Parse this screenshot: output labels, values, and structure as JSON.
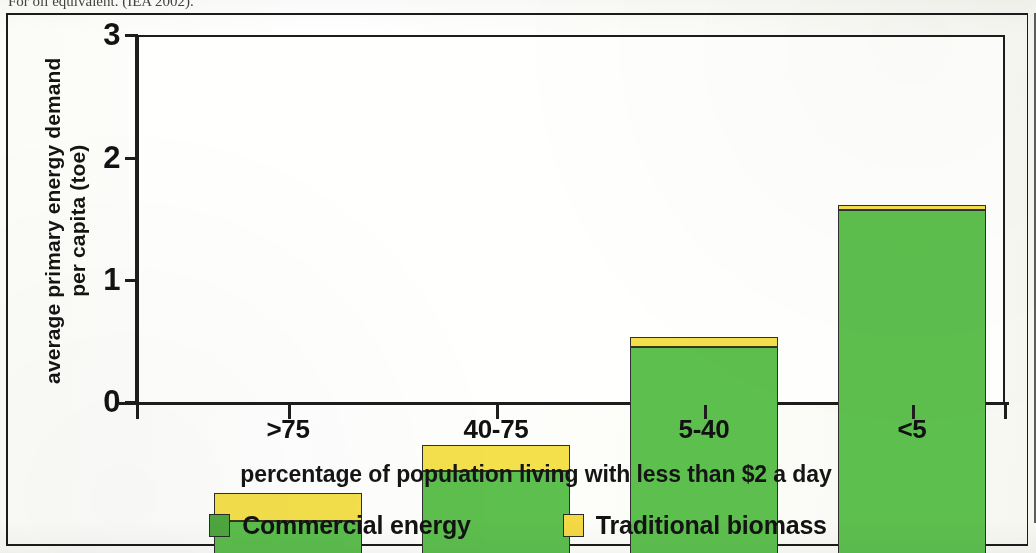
{
  "caption_clipped": "For oil equivalent. (IEA 2002).",
  "chart_data": {
    "type": "bar",
    "stacked": true,
    "title": "",
    "xlabel": "percentage of population living with less than $2 a day",
    "ylabel": "average primary energy demand per capita (toe)",
    "ylabel_line1": "average primary energy demand",
    "ylabel_line2": "per capita (toe)",
    "categories": [
      ">75",
      "40-75",
      "5-40",
      "<5"
    ],
    "ylim": [
      0,
      3
    ],
    "yticks": [
      "0",
      "1",
      "2",
      "3"
    ],
    "ytick_values": [
      0,
      1,
      2,
      3
    ],
    "grid": false,
    "legend_position": "bottom",
    "series": [
      {
        "name": "Commercial energy",
        "color": "#5dbf4e",
        "values": [
          0.26,
          0.67,
          1.68,
          2.8
        ]
      },
      {
        "name": "Traditional biomass",
        "color": "#f4e04b",
        "values": [
          0.23,
          0.21,
          0.08,
          0.04
        ]
      }
    ],
    "totals": [
      0.49,
      0.88,
      1.76,
      2.84
    ]
  },
  "axes": {
    "y_title_line1": "average primary energy demand",
    "y_title_line2": "per capita (toe)",
    "y_ticks": [
      "3",
      "2",
      "1",
      "0"
    ],
    "x_categories": [
      ">75",
      "40-75",
      "5-40",
      "<5"
    ],
    "x_title": "percentage of population living with less than $2 a day"
  },
  "legend": {
    "items": [
      {
        "label": "Commercial energy",
        "color": "#5dbf4e"
      },
      {
        "label": "Traditional biomass",
        "color": "#f4e04b"
      }
    ]
  }
}
